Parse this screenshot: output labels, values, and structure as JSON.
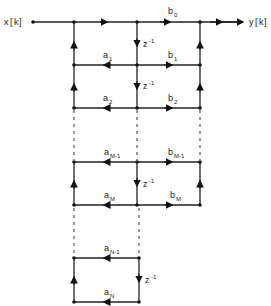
{
  "diagram": {
    "type": "signal-flow-graph",
    "input_label": "x[k]",
    "output_label": "y[k]",
    "delay_label": "z⁻¹",
    "feedforward_coeffs": [
      "b0",
      "b1",
      "b2",
      "bM-1",
      "bM"
    ],
    "feedback_coeffs": [
      "a1",
      "a2",
      "aM-1",
      "aM",
      "aN-1",
      "aN"
    ],
    "labels": {
      "x": "x",
      "k": "k",
      "y": "y",
      "b": "b",
      "a": "a",
      "z": "z",
      "zexp": "-1",
      "s0": "0",
      "s1": "1",
      "s2": "2",
      "sM1": "M-1",
      "sM": "M",
      "sN1": "N-1",
      "sN": "N"
    }
  }
}
